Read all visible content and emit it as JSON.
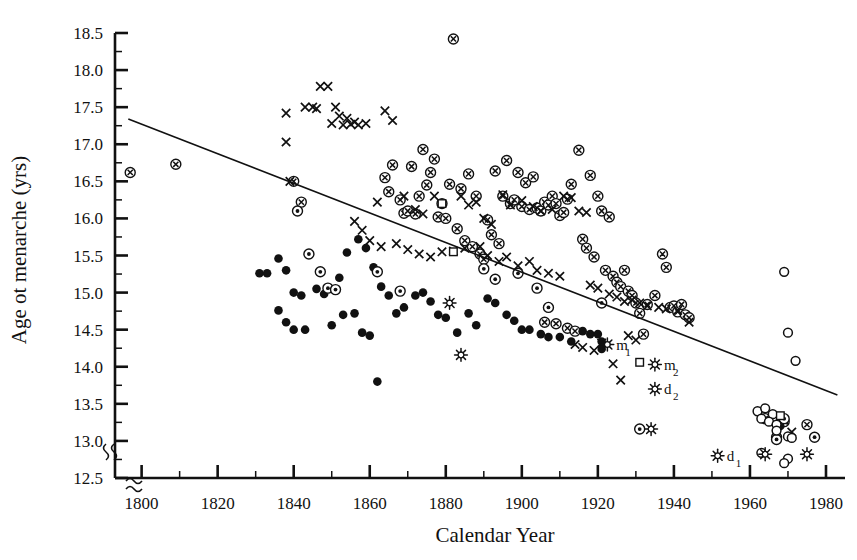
{
  "chart_data": {
    "type": "scatter",
    "title": "",
    "xlabel": "Calendar Year",
    "ylabel": "Age ot menarche (yrs)",
    "xlim": [
      1793,
      1985
    ],
    "ylim": [
      12.5,
      18.5
    ],
    "xticks": [
      1800,
      1820,
      1840,
      1860,
      1880,
      1900,
      1920,
      1940,
      1960,
      1980
    ],
    "xtick_labels": [
      "1800",
      "1820",
      "1840",
      "1860",
      "1880",
      "1900",
      "1920",
      "1940",
      "1960",
      "1980"
    ],
    "x_minor_step": 10,
    "yticks": [
      12.5,
      13.0,
      13.5,
      14.0,
      14.5,
      15.0,
      15.5,
      16.0,
      16.5,
      17.0,
      17.5,
      18.0,
      18.5
    ],
    "ytick_labels": [
      "12.5",
      "13.0",
      "13.5",
      "14.0",
      "14.5",
      "15.0",
      "15.5",
      "16.0",
      "16.5",
      "17.0",
      "17.5",
      "18.0",
      "18.5"
    ],
    "y_minor_step": 0.25,
    "grid": false,
    "axis_break_x": true,
    "axis_break_y": true,
    "legend_position": "none",
    "trendline": {
      "name": "linear regression",
      "x0": 1796.5,
      "y0": 17.34,
      "x1": 1983.0,
      "y1": 13.62
    },
    "annotations": [
      {
        "label": "m",
        "sub": "1",
        "x": 1922.5,
        "y": 14.3
      },
      {
        "label": "m",
        "sub": "2",
        "x": 1935.0,
        "y": 14.03
      },
      {
        "label": "d",
        "sub": "2",
        "x": 1935.0,
        "y": 13.7
      },
      {
        "label": "d",
        "sub": "1",
        "x": 1951.5,
        "y": 12.8
      }
    ],
    "series": [
      {
        "name": "circled-x",
        "marker": "circled-x",
        "points": [
          [
            1797,
            16.62
          ],
          [
            1809,
            16.73
          ],
          [
            1842,
            16.22
          ],
          [
            1840,
            16.5
          ],
          [
            1882,
            18.42
          ],
          [
            1866,
            16.72
          ],
          [
            1871,
            16.7
          ],
          [
            1874,
            16.93
          ],
          [
            1876,
            16.62
          ],
          [
            1877,
            16.8
          ],
          [
            1879,
            16.2
          ],
          [
            1881,
            16.46
          ],
          [
            1884,
            16.4
          ],
          [
            1886,
            16.6
          ],
          [
            1888,
            16.3
          ],
          [
            1864,
            16.55
          ],
          [
            1865,
            16.36
          ],
          [
            1868,
            16.25
          ],
          [
            1869,
            16.07
          ],
          [
            1870,
            16.1
          ],
          [
            1872,
            16.06
          ],
          [
            1873,
            16.3
          ],
          [
            1875,
            16.45
          ],
          [
            1878,
            16.02
          ],
          [
            1880,
            16.0
          ],
          [
            1883,
            15.86
          ],
          [
            1885,
            15.7
          ],
          [
            1887,
            15.62
          ],
          [
            1889,
            15.52
          ],
          [
            1890,
            15.45
          ],
          [
            1893,
            16.64
          ],
          [
            1896,
            16.78
          ],
          [
            1899,
            16.62
          ],
          [
            1901,
            16.48
          ],
          [
            1903,
            16.56
          ],
          [
            1895,
            16.3
          ],
          [
            1897,
            16.2
          ],
          [
            1898,
            16.25
          ],
          [
            1900,
            16.16
          ],
          [
            1902,
            16.12
          ],
          [
            1904,
            16.14
          ],
          [
            1905,
            16.1
          ],
          [
            1906,
            16.22
          ],
          [
            1907,
            16.18
          ],
          [
            1908,
            16.3
          ],
          [
            1909,
            16.2
          ],
          [
            1910,
            16.04
          ],
          [
            1911,
            16.08
          ],
          [
            1912,
            16.26
          ],
          [
            1913,
            16.46
          ],
          [
            1915,
            16.92
          ],
          [
            1918,
            16.58
          ],
          [
            1920,
            16.3
          ],
          [
            1921,
            16.1
          ],
          [
            1923,
            16.02
          ],
          [
            1891,
            15.98
          ],
          [
            1892,
            15.78
          ],
          [
            1894,
            15.66
          ],
          [
            1916,
            15.72
          ],
          [
            1917,
            15.6
          ],
          [
            1919,
            15.48
          ],
          [
            1922,
            15.3
          ],
          [
            1924,
            15.22
          ],
          [
            1925,
            15.14
          ],
          [
            1926,
            15.08
          ],
          [
            1927,
            15.3
          ],
          [
            1928,
            15.02
          ],
          [
            1929,
            14.96
          ],
          [
            1930,
            14.86
          ],
          [
            1931,
            14.72
          ],
          [
            1933,
            14.84
          ],
          [
            1935,
            14.96
          ],
          [
            1937,
            15.52
          ],
          [
            1938,
            15.34
          ],
          [
            1939,
            14.8
          ],
          [
            1940,
            14.82
          ],
          [
            1941,
            14.74
          ],
          [
            1942,
            14.84
          ],
          [
            1943,
            14.7
          ],
          [
            1944,
            14.66
          ],
          [
            1906,
            14.6
          ],
          [
            1909,
            14.58
          ],
          [
            1912,
            14.52
          ],
          [
            1914,
            14.48
          ],
          [
            1932,
            14.44
          ],
          [
            1964,
            13.3
          ],
          [
            1969,
            13.26
          ],
          [
            1975,
            13.22
          ],
          [
            1967,
            13.05
          ]
        ]
      },
      {
        "name": "cross",
        "marker": "x",
        "points": [
          [
            1838,
            17.42
          ],
          [
            1843,
            17.5
          ],
          [
            1847,
            17.78
          ],
          [
            1849,
            17.78
          ],
          [
            1845,
            17.5
          ],
          [
            1846,
            17.48
          ],
          [
            1851,
            17.5
          ],
          [
            1852,
            17.38
          ],
          [
            1854,
            17.35
          ],
          [
            1856,
            17.3
          ],
          [
            1850,
            17.28
          ],
          [
            1853,
            17.26
          ],
          [
            1855,
            17.27
          ],
          [
            1857,
            17.26
          ],
          [
            1859,
            17.28
          ],
          [
            1864,
            17.45
          ],
          [
            1866,
            17.32
          ],
          [
            1838,
            17.03
          ],
          [
            1839,
            16.5
          ],
          [
            1862,
            16.22
          ],
          [
            1869,
            16.3
          ],
          [
            1872,
            16.12
          ],
          [
            1874,
            16.06
          ],
          [
            1877,
            16.3
          ],
          [
            1884,
            16.3
          ],
          [
            1886,
            16.18
          ],
          [
            1888,
            16.22
          ],
          [
            1890,
            16.0
          ],
          [
            1892,
            15.92
          ],
          [
            1895,
            16.32
          ],
          [
            1897,
            16.18
          ],
          [
            1900,
            16.24
          ],
          [
            1903,
            16.16
          ],
          [
            1905,
            16.1
          ],
          [
            1908,
            16.12
          ],
          [
            1911,
            16.3
          ],
          [
            1913,
            16.28
          ],
          [
            1915,
            16.1
          ],
          [
            1917,
            16.08
          ],
          [
            1856,
            15.96
          ],
          [
            1858,
            15.84
          ],
          [
            1860,
            15.7
          ],
          [
            1863,
            15.62
          ],
          [
            1867,
            15.66
          ],
          [
            1870,
            15.58
          ],
          [
            1873,
            15.52
          ],
          [
            1876,
            15.48
          ],
          [
            1879,
            15.55
          ],
          [
            1882,
            15.56
          ],
          [
            1885,
            15.6
          ],
          [
            1889,
            15.62
          ],
          [
            1891,
            15.5
          ],
          [
            1894,
            15.42
          ],
          [
            1896,
            15.48
          ],
          [
            1899,
            15.36
          ],
          [
            1902,
            15.42
          ],
          [
            1904,
            15.3
          ],
          [
            1907,
            15.26
          ],
          [
            1910,
            15.22
          ],
          [
            1918,
            15.1
          ],
          [
            1920,
            15.06
          ],
          [
            1923,
            14.98
          ],
          [
            1925,
            14.94
          ],
          [
            1927,
            14.88
          ],
          [
            1929,
            14.9
          ],
          [
            1931,
            14.86
          ],
          [
            1933,
            14.82
          ],
          [
            1936,
            14.8
          ],
          [
            1938,
            14.78
          ],
          [
            1941,
            14.76
          ],
          [
            1944,
            14.6
          ],
          [
            1928,
            14.42
          ],
          [
            1930,
            14.36
          ],
          [
            1914,
            14.3
          ],
          [
            1916,
            14.26
          ],
          [
            1919,
            14.22
          ],
          [
            1921,
            14.32
          ],
          [
            1924,
            14.04
          ],
          [
            1926,
            13.82
          ],
          [
            1969,
            13.28
          ],
          [
            1971,
            13.12
          ]
        ]
      },
      {
        "name": "filled-circle",
        "marker": "filled-circle",
        "points": [
          [
            1831,
            15.26
          ],
          [
            1833,
            15.26
          ],
          [
            1836,
            15.46
          ],
          [
            1838,
            15.3
          ],
          [
            1840,
            15.0
          ],
          [
            1842,
            14.96
          ],
          [
            1836,
            14.76
          ],
          [
            1838,
            14.6
          ],
          [
            1840,
            14.5
          ],
          [
            1843,
            14.5
          ],
          [
            1846,
            15.05
          ],
          [
            1848,
            14.98
          ],
          [
            1852,
            15.2
          ],
          [
            1854,
            15.54
          ],
          [
            1857,
            15.72
          ],
          [
            1859,
            15.6
          ],
          [
            1861,
            15.34
          ],
          [
            1863,
            15.08
          ],
          [
            1865,
            14.96
          ],
          [
            1850,
            14.56
          ],
          [
            1853,
            14.7
          ],
          [
            1856,
            14.72
          ],
          [
            1858,
            14.46
          ],
          [
            1860,
            14.42
          ],
          [
            1862,
            13.8
          ],
          [
            1867,
            14.72
          ],
          [
            1869,
            14.8
          ],
          [
            1872,
            14.96
          ],
          [
            1874,
            15.0
          ],
          [
            1876,
            14.88
          ],
          [
            1878,
            14.7
          ],
          [
            1880,
            14.66
          ],
          [
            1883,
            14.46
          ],
          [
            1886,
            14.72
          ],
          [
            1888,
            14.56
          ],
          [
            1891,
            14.92
          ],
          [
            1893,
            14.86
          ],
          [
            1896,
            14.7
          ],
          [
            1898,
            14.62
          ],
          [
            1900,
            14.5
          ],
          [
            1902,
            14.5
          ],
          [
            1905,
            14.44
          ],
          [
            1907,
            14.4
          ],
          [
            1910,
            14.4
          ],
          [
            1913,
            14.34
          ],
          [
            1916,
            14.48
          ],
          [
            1918,
            14.44
          ],
          [
            1920,
            14.44
          ],
          [
            1921,
            14.34
          ],
          [
            1921,
            14.24
          ],
          [
            1968,
            13.2
          ]
        ]
      },
      {
        "name": "dotted-circle",
        "marker": "dotted-circle",
        "points": [
          [
            1841,
            16.1
          ],
          [
            1844,
            15.52
          ],
          [
            1847,
            15.28
          ],
          [
            1849,
            15.06
          ],
          [
            1851,
            15.04
          ],
          [
            1862,
            15.28
          ],
          [
            1868,
            15.02
          ],
          [
            1890,
            15.32
          ],
          [
            1893,
            15.18
          ],
          [
            1899,
            15.26
          ],
          [
            1904,
            15.06
          ],
          [
            1907,
            14.8
          ],
          [
            1921,
            14.86
          ],
          [
            1931,
            13.16
          ],
          [
            1969,
            13.3
          ],
          [
            1967,
            13.02
          ],
          [
            1977,
            13.05
          ]
        ]
      },
      {
        "name": "open-circle",
        "marker": "open-circle",
        "points": [
          [
            1969,
            15.28
          ],
          [
            1970,
            14.46
          ],
          [
            1972,
            14.08
          ],
          [
            1962,
            13.4
          ],
          [
            1964,
            13.44
          ],
          [
            1966,
            13.36
          ],
          [
            1963,
            13.3
          ],
          [
            1965,
            13.26
          ],
          [
            1967,
            13.22
          ],
          [
            1967,
            13.14
          ],
          [
            1970,
            13.06
          ],
          [
            1971,
            13.04
          ],
          [
            1963,
            12.84
          ],
          [
            1970,
            12.76
          ],
          [
            1969,
            12.7
          ]
        ]
      },
      {
        "name": "open-square",
        "marker": "open-square",
        "points": [
          [
            1879,
            16.2
          ],
          [
            1882,
            15.55
          ],
          [
            1931,
            14.06
          ],
          [
            1968,
            13.34
          ]
        ]
      },
      {
        "name": "star",
        "marker": "star",
        "points": [
          [
            1881,
            14.86
          ],
          [
            1884,
            14.16
          ],
          [
            1922.5,
            14.3
          ],
          [
            1935,
            14.03
          ],
          [
            1935,
            13.7
          ],
          [
            1934,
            13.16
          ],
          [
            1951.5,
            12.8
          ],
          [
            1964,
            12.82
          ],
          [
            1975,
            12.82
          ]
        ]
      }
    ]
  }
}
